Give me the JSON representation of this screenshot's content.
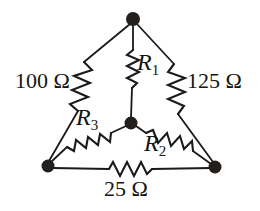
{
  "figure": {
    "kind": "circuit-diagram",
    "stroke_color": "#1a1a1a",
    "node_color": "#231f1c",
    "background": "#ffffff"
  },
  "labels": {
    "left_resistor": "100 Ω",
    "right_resistor": "125 Ω",
    "bottom_resistor": "25 Ω",
    "inner_top": "R",
    "inner_top_sub": "1",
    "inner_right": "R",
    "inner_right_sub": "2",
    "inner_left": "R",
    "inner_left_sub": "3"
  },
  "nodes": [
    {
      "name": "top-node",
      "x": 133,
      "y": 19,
      "r": 7
    },
    {
      "name": "center-node",
      "x": 131,
      "y": 123,
      "r": 6.5
    },
    {
      "name": "bottom-left-node",
      "x": 48,
      "y": 166,
      "r": 6.5
    },
    {
      "name": "bottom-right-node",
      "x": 215,
      "y": 167,
      "r": 6.5
    }
  ]
}
